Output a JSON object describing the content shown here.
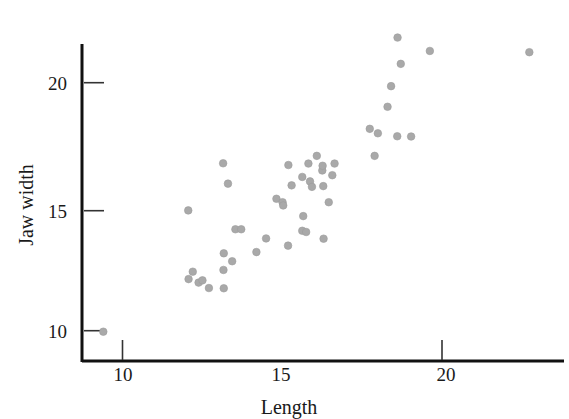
{
  "chart_data": {
    "type": "scatter",
    "title": "",
    "xlabel": "Length",
    "ylabel": "Jaw width",
    "xlim": [
      8.8,
      23.2
    ],
    "ylim": [
      9.0,
      22.4
    ],
    "xticks": [
      10,
      15,
      20
    ],
    "xtick_labels": [
      "10",
      "15",
      "20"
    ],
    "xtick_marks_drawn": [
      10,
      20
    ],
    "yticks": [
      10,
      15,
      20
    ],
    "ytick_labels": [
      "10",
      "15",
      "20"
    ],
    "grid": false,
    "legend": null,
    "marker": {
      "shape": "circle",
      "color": "#a9a9a9",
      "size_px": 7.6
    },
    "n_points": 48,
    "points": [
      {
        "x": 9.39,
        "y": 9.96
      },
      {
        "x": 12.02,
        "y": 14.85
      },
      {
        "x": 12.03,
        "y": 12.08
      },
      {
        "x": 12.16,
        "y": 12.38
      },
      {
        "x": 12.34,
        "y": 11.94
      },
      {
        "x": 12.46,
        "y": 12.03
      },
      {
        "x": 12.66,
        "y": 11.72
      },
      {
        "x": 13.1,
        "y": 16.75
      },
      {
        "x": 13.11,
        "y": 12.45
      },
      {
        "x": 13.12,
        "y": 13.12
      },
      {
        "x": 13.12,
        "y": 11.71
      },
      {
        "x": 13.25,
        "y": 15.93
      },
      {
        "x": 13.38,
        "y": 12.8
      },
      {
        "x": 13.48,
        "y": 14.09
      },
      {
        "x": 13.66,
        "y": 14.09
      },
      {
        "x": 14.13,
        "y": 13.17
      },
      {
        "x": 14.43,
        "y": 13.72
      },
      {
        "x": 14.75,
        "y": 15.32
      },
      {
        "x": 14.94,
        "y": 15.18
      },
      {
        "x": 14.96,
        "y": 15.05
      },
      {
        "x": 15.12,
        "y": 16.68
      },
      {
        "x": 15.11,
        "y": 13.43
      },
      {
        "x": 15.22,
        "y": 15.86
      },
      {
        "x": 15.55,
        "y": 16.2
      },
      {
        "x": 15.55,
        "y": 14.03
      },
      {
        "x": 15.58,
        "y": 14.62
      },
      {
        "x": 15.67,
        "y": 13.98
      },
      {
        "x": 15.74,
        "y": 16.74
      },
      {
        "x": 15.79,
        "y": 16.02
      },
      {
        "x": 15.85,
        "y": 15.8
      },
      {
        "x": 16.0,
        "y": 17.05
      },
      {
        "x": 16.17,
        "y": 16.46
      },
      {
        "x": 16.18,
        "y": 16.65
      },
      {
        "x": 16.2,
        "y": 15.83
      },
      {
        "x": 16.21,
        "y": 13.71
      },
      {
        "x": 16.37,
        "y": 15.18
      },
      {
        "x": 16.48,
        "y": 16.27
      },
      {
        "x": 16.55,
        "y": 16.74
      },
      {
        "x": 17.64,
        "y": 18.14
      },
      {
        "x": 17.79,
        "y": 17.05
      },
      {
        "x": 17.89,
        "y": 17.96
      },
      {
        "x": 18.19,
        "y": 19.03
      },
      {
        "x": 18.3,
        "y": 19.86
      },
      {
        "x": 18.49,
        "y": 17.84
      },
      {
        "x": 18.5,
        "y": 21.82
      },
      {
        "x": 18.6,
        "y": 20.76
      },
      {
        "x": 18.92,
        "y": 17.83
      },
      {
        "x": 19.5,
        "y": 21.28
      },
      {
        "x": 22.58,
        "y": 21.23
      }
    ]
  },
  "axes": {
    "x_axis_label": "Length",
    "y_axis_label": "Jaw width",
    "x_tick_labels": [
      "10",
      "15",
      "20"
    ],
    "y_tick_labels": [
      "10",
      "15",
      "20"
    ]
  }
}
